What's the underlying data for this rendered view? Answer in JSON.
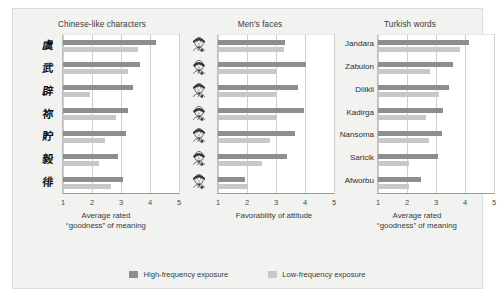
{
  "figure": {
    "background": "#f2f2f0",
    "colors": {
      "high": "#8e8e8e",
      "low": "#c8c8c8",
      "grid": "#cfcfcf",
      "plot_bg": "#ffffff"
    }
  },
  "legend": {
    "position": "bottom-center",
    "items": [
      {
        "label": "High-frequency exposure",
        "color": "#8e8e8e",
        "key": "high"
      },
      {
        "label": "Low-frequency exposure",
        "color": "#c8c8c8",
        "key": "low"
      }
    ]
  },
  "chart_data": [
    {
      "type": "bar",
      "title": "Chinese-like characters",
      "xlabel": "Average rated\n“goodness” of meaning",
      "ylabel": "",
      "orientation": "horizontal",
      "xlim": [
        1,
        5
      ],
      "xticks": [
        1,
        2,
        3,
        4,
        5
      ],
      "ticklabels": [
        "1",
        "2",
        "3",
        "4",
        "5"
      ],
      "grid": true,
      "legend": "bottom",
      "categories": [
        "char-1",
        "char-2",
        "char-3",
        "char-4",
        "char-5",
        "char-6",
        "char-7"
      ],
      "category_glyphs": [
        "虞",
        "武",
        "辟",
        "祢",
        "貯",
        "毅",
        "徘"
      ],
      "series": [
        {
          "name": "High-frequency exposure",
          "color": "#8e8e8e",
          "values": [
            4.2,
            3.67,
            3.43,
            3.25,
            3.17,
            2.89,
            3.07
          ]
        },
        {
          "name": "Low-frequency exposure",
          "color": "#c8c8c8",
          "values": [
            3.6,
            3.25,
            1.94,
            2.82,
            2.46,
            2.25,
            2.67
          ]
        }
      ]
    },
    {
      "type": "bar",
      "title": "Men's faces",
      "xlabel": "Favorability of attitude",
      "ylabel": "",
      "orientation": "horizontal",
      "xlim": [
        1,
        5
      ],
      "xticks": [
        1,
        2,
        3,
        4,
        5
      ],
      "ticklabels": [
        "1",
        "2",
        "3",
        "4",
        "5"
      ],
      "grid": true,
      "legend": "bottom",
      "categories": [
        "face-1",
        "face-2",
        "face-3",
        "face-4",
        "face-5",
        "face-6",
        "face-7"
      ],
      "series": [
        {
          "name": "High-frequency exposure",
          "color": "#8e8e8e",
          "values": [
            3.31,
            4.04,
            3.77,
            3.97,
            3.65,
            3.37,
            1.93
          ]
        },
        {
          "name": "Low-frequency exposure",
          "color": "#c8c8c8",
          "values": [
            3.27,
            3.02,
            2.99,
            2.99,
            2.81,
            2.53,
            2.03
          ]
        }
      ]
    },
    {
      "type": "bar",
      "title": "Turkish words",
      "xlabel": "Average rated\n“goodness” of meaning",
      "ylabel": "",
      "orientation": "horizontal",
      "xlim": [
        1,
        5
      ],
      "xticks": [
        1,
        2,
        3,
        4,
        5
      ],
      "ticklabels": [
        "1",
        "2",
        "3",
        "4",
        "5"
      ],
      "grid": true,
      "legend": "bottom",
      "categories": [
        "Jandara",
        "Zabulon",
        "Dilikli",
        "Kadirga",
        "Nansoma",
        "Saricik",
        "Afworbu"
      ],
      "series": [
        {
          "name": "High-frequency exposure",
          "color": "#8e8e8e",
          "values": [
            4.13,
            3.57,
            3.46,
            3.24,
            3.2,
            3.06,
            2.49
          ]
        },
        {
          "name": "Low-frequency exposure",
          "color": "#c8c8c8",
          "values": [
            3.82,
            2.81,
            3.1,
            2.67,
            2.77,
            2.06,
            2.06
          ]
        }
      ]
    }
  ]
}
